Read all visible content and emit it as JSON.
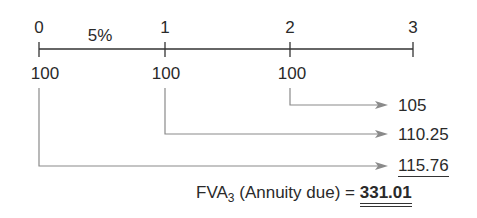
{
  "timeline": {
    "periods": [
      "0",
      "1",
      "2",
      "3"
    ],
    "rate_label": "5%",
    "payments": [
      "100",
      "100",
      "100"
    ]
  },
  "future_values": [
    {
      "from_period": "2",
      "value": "105"
    },
    {
      "from_period": "1",
      "value": "110.25"
    },
    {
      "from_period": "0",
      "value": "115.76"
    }
  ],
  "result": {
    "prefix": "FVA",
    "subscript": "3",
    "description": " (Annuity due) = ",
    "value": "331.01"
  },
  "colors": {
    "axis": "#333333",
    "arrows": "#8a8a8a",
    "text": "#2a2a2a"
  }
}
